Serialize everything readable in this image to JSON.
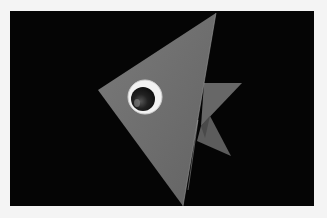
{
  "image": {
    "subject": "origami paper fish with googly eye",
    "colors": {
      "frame": "#f4f4f4",
      "background": "#050505",
      "fish_body": "#6f6f6f",
      "fish_body_highlight": "#7d7d7d",
      "fin": "#666666",
      "fin_shadow": "#4a4a4a",
      "eye_white": "#f2f2f2",
      "pupil": "#1a1a1a"
    }
  }
}
